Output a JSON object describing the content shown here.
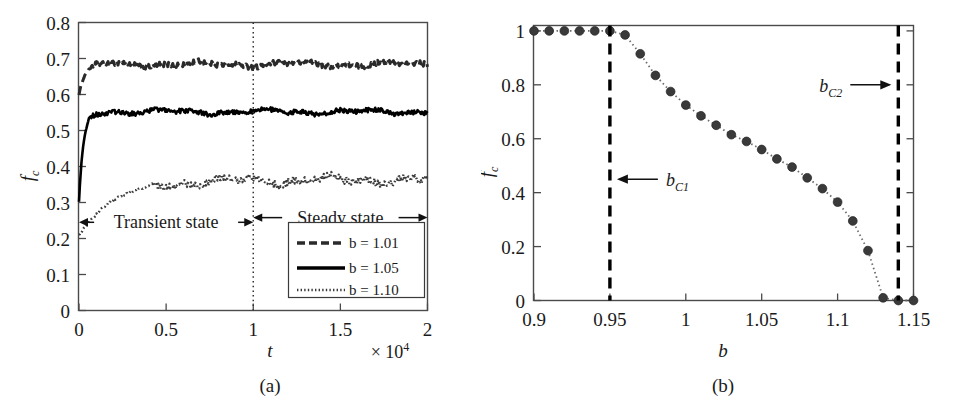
{
  "figure": {
    "background": "#ffffff",
    "ink": "#1a1a1a"
  },
  "chart_data": [
    {
      "id": "panel-a",
      "type": "line",
      "title": "",
      "caption": "(a)",
      "xlabel": "t",
      "ylabel": "f_c",
      "ylabel_base": "f",
      "ylabel_sub": "c",
      "x_multiplier": "× 10",
      "x_multiplier_exp": "4",
      "xlim": [
        0,
        2
      ],
      "ylim": [
        0,
        0.8
      ],
      "xticks": [
        0,
        0.5,
        1,
        1.5,
        2
      ],
      "xtick_labels": [
        "0",
        "0.5",
        "1",
        "1.5",
        "2"
      ],
      "yticks": [
        0,
        0.1,
        0.2,
        0.3,
        0.4,
        0.5,
        0.6,
        0.7,
        0.8
      ],
      "ytick_labels": [
        "0",
        "0.1",
        "0.2",
        "0.3",
        "0.4",
        "0.5",
        "0.6",
        "0.7",
        "0.8"
      ],
      "grid": false,
      "legend_position": "lower-right",
      "series": [
        {
          "name": "b = 1.01",
          "style": "dashed",
          "color": "#2a2a2a",
          "start_value": 0.6,
          "plateau_value": 0.684,
          "noise": 0.009,
          "rise_tau": 0.035
        },
        {
          "name": "b = 1.05",
          "style": "solid",
          "color": "#000000",
          "start_value": 0.3,
          "plateau_value": 0.552,
          "noise": 0.008,
          "rise_tau": 0.025
        },
        {
          "name": "b = 1.10",
          "style": "dotted",
          "color": "#3a3a3a",
          "start_value": 0.21,
          "plateau_value": 0.362,
          "noise": 0.014,
          "rise_tau": 0.2
        }
      ],
      "annotations": [
        {
          "text": "Transient state",
          "x_from": 0,
          "x_to": 1,
          "y": 0.245,
          "arrow": "double"
        },
        {
          "text": "Steady state",
          "x_from": 1,
          "x_to": 2,
          "y": 0.258,
          "arrow": "double"
        }
      ],
      "divider": {
        "x": 1,
        "style": "dotted",
        "label": ""
      }
    },
    {
      "id": "panel-b",
      "type": "scatter",
      "title": "",
      "caption": "(b)",
      "xlabel": "b",
      "ylabel": "f_c",
      "ylabel_base": "f",
      "ylabel_sub": "c",
      "xlim": [
        0.9,
        1.15
      ],
      "ylim": [
        0,
        1.02
      ],
      "xticks": [
        0.9,
        0.95,
        1,
        1.05,
        1.1,
        1.15
      ],
      "xtick_labels": [
        "0.9",
        "0.95",
        "1",
        "1.05",
        "1.1",
        "1.15"
      ],
      "yticks": [
        0,
        0.2,
        0.4,
        0.6,
        0.8,
        1
      ],
      "ytick_labels": [
        "0",
        "0.2",
        "0.4",
        "0.6",
        "0.8",
        "1"
      ],
      "grid": false,
      "marker": "circle",
      "marker_color": "#3a3a3a",
      "line_style": "dotted",
      "x": [
        0.9,
        0.91,
        0.92,
        0.93,
        0.94,
        0.95,
        0.96,
        0.97,
        0.98,
        0.99,
        1.0,
        1.01,
        1.02,
        1.03,
        1.04,
        1.05,
        1.06,
        1.07,
        1.08,
        1.09,
        1.1,
        1.11,
        1.12,
        1.13,
        1.14,
        1.15
      ],
      "values": [
        1.0,
        1.0,
        1.0,
        1.0,
        1.0,
        1.0,
        0.985,
        0.915,
        0.835,
        0.775,
        0.725,
        0.685,
        0.65,
        0.615,
        0.59,
        0.56,
        0.525,
        0.495,
        0.455,
        0.415,
        0.365,
        0.295,
        0.185,
        0.01,
        0.0,
        0.0
      ],
      "vlines": [
        {
          "x": 0.95,
          "style": "dashed",
          "label": "b_C1",
          "label_base": "b",
          "label_sub": "C1",
          "arrow": "left"
        },
        {
          "x": 1.14,
          "style": "dashed",
          "label": "b_C2",
          "label_base": "b",
          "label_sub": "C2",
          "arrow": "right"
        }
      ]
    }
  ]
}
